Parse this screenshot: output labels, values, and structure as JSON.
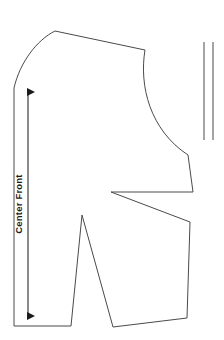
{
  "canvas": {
    "width": 224,
    "height": 340,
    "background_color": "#ffffff"
  },
  "style": {
    "outline_color": "#4a4a4a",
    "outline_width": 1,
    "marking_color": "#2b2b2b",
    "marking_width": 1.1,
    "text_color": "#1a1a1a",
    "fill_color": "#ffffff"
  },
  "drawing": {
    "title": "Center Front",
    "type": "sewing-pattern-piece",
    "pieces": [
      {
        "name": "bodice-front-pattern-outline",
        "label": "front pattern piece outline",
        "segments": [
          {
            "kind": "move",
            "x": 14,
            "y": 88
          },
          {
            "kind": "curve",
            "c1x": 20,
            "c1y": 62,
            "c2x": 37,
            "c2y": 40,
            "x": 55,
            "y": 31
          },
          {
            "kind": "line",
            "x": 145,
            "y": 50
          },
          {
            "kind": "curve",
            "c1x": 139,
            "c1y": 86,
            "c2x": 150,
            "c2y": 130,
            "x": 188,
            "y": 155
          },
          {
            "kind": "line",
            "x": 193,
            "y": 192
          },
          {
            "kind": "line",
            "x": 111,
            "y": 192
          },
          {
            "kind": "line",
            "x": 190,
            "y": 222
          },
          {
            "kind": "line",
            "x": 187,
            "y": 318
          },
          {
            "kind": "line",
            "x": 113,
            "y": 327
          },
          {
            "kind": "line",
            "x": 82,
            "y": 215
          },
          {
            "kind": "line",
            "x": 71,
            "y": 326
          },
          {
            "kind": "line",
            "x": 14,
            "y": 326
          },
          {
            "kind": "close"
          }
        ]
      }
    ],
    "grainline": {
      "name": "center-front-grainline",
      "label": "Center Front",
      "line": {
        "x1": 28,
        "y1": 92,
        "x2": 28,
        "y2": 316
      },
      "arrowheads": "both",
      "arrow_size": 4.5,
      "text": {
        "value": "Center Front",
        "x": 22,
        "y": 204,
        "rotation": -90,
        "font_size": 9.5,
        "anchor": "middle"
      }
    },
    "extra_marks": [
      {
        "name": "grainline-guide-line-left",
        "label": "vertical guide line left",
        "x1": 204,
        "y1": 42,
        "x2": 204,
        "y2": 140
      },
      {
        "name": "grainline-guide-line-right",
        "label": "vertical guide line right",
        "x1": 213,
        "y1": 42,
        "x2": 213,
        "y2": 140
      }
    ]
  }
}
